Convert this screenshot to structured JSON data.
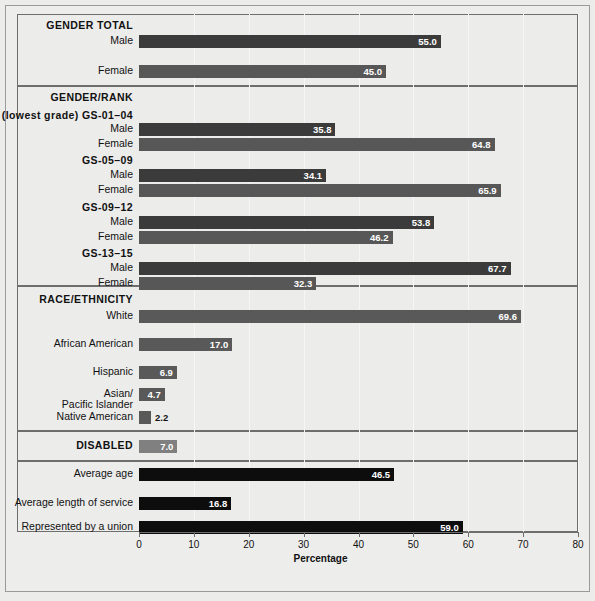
{
  "chart_data": {
    "type": "bar",
    "title": "",
    "xlabel": "Percentage",
    "ylabel": "",
    "xlim": [
      0,
      80
    ],
    "xticks": [
      0,
      10,
      20,
      30,
      40,
      50,
      60,
      70,
      80
    ],
    "grid": true,
    "orientation": "horizontal",
    "legend": "none",
    "colors": {
      "male": "#3b3b3b",
      "female": "#575757",
      "race": "#595959",
      "disabled": "#808080",
      "other": "#0d0d0d",
      "panel_background": "#ececeb",
      "border": "#6e6e6e",
      "gridline": "#f6f6f6",
      "label_inside": "#ffffff",
      "label_outside": "#111111"
    },
    "sections": [
      {
        "name": "gender-total",
        "heading": "GENDER TOTAL",
        "subheadings": [],
        "rows": [
          {
            "label": "Male",
            "value": 55.0,
            "display": "55.0",
            "series": "male",
            "label_position": "inside"
          },
          {
            "label": "Female",
            "value": 45.0,
            "display": "45.0",
            "series": "female",
            "label_position": "inside"
          }
        ]
      },
      {
        "name": "gender-rank",
        "heading": "GENDER/RANK",
        "subheadings": [
          "(lowest grade) GS-01–04",
          "GS-05–09",
          "GS-09–12",
          "GS-13–15"
        ],
        "rows": [
          {
            "label": "(lowest grade) GS-01–04",
            "value": null,
            "display": "",
            "series": "subheading",
            "label_position": "none"
          },
          {
            "label": "Male",
            "value": 35.8,
            "display": "35.8",
            "series": "male",
            "label_position": "inside"
          },
          {
            "label": "Female",
            "value": 64.8,
            "display": "64.8",
            "series": "female",
            "label_position": "inside"
          },
          {
            "label": "GS-05–09",
            "value": null,
            "display": "",
            "series": "subheading",
            "label_position": "none"
          },
          {
            "label": "Male",
            "value": 34.1,
            "display": "34.1",
            "series": "male",
            "label_position": "inside"
          },
          {
            "label": "Female",
            "value": 65.9,
            "display": "65.9",
            "series": "female",
            "label_position": "inside"
          },
          {
            "label": "GS-09–12",
            "value": null,
            "display": "",
            "series": "subheading",
            "label_position": "none"
          },
          {
            "label": "Male",
            "value": 53.8,
            "display": "53.8",
            "series": "male",
            "label_position": "inside"
          },
          {
            "label": "Female",
            "value": 46.2,
            "display": "46.2",
            "series": "female",
            "label_position": "inside"
          },
          {
            "label": "GS-13–15",
            "value": null,
            "display": "",
            "series": "subheading",
            "label_position": "none"
          },
          {
            "label": "Male",
            "value": 67.7,
            "display": "67.7",
            "series": "male",
            "label_position": "inside"
          },
          {
            "label": "Female",
            "value": 32.3,
            "display": "32.3",
            "series": "female",
            "label_position": "inside"
          }
        ]
      },
      {
        "name": "race-ethnicity",
        "heading": "RACE/ETHNICITY",
        "subheadings": [],
        "rows": [
          {
            "label": "White",
            "value": 69.6,
            "display": "69.6",
            "series": "race",
            "label_position": "inside"
          },
          {
            "label": "African American",
            "value": 17.0,
            "display": "17.0",
            "series": "race",
            "label_position": "inside"
          },
          {
            "label": "Hispanic",
            "value": 6.9,
            "display": "6.9",
            "series": "race",
            "label_position": "inside"
          },
          {
            "label": "Asian/\nPacific Islander",
            "value": 4.7,
            "display": "4.7",
            "series": "race",
            "label_position": "inside"
          },
          {
            "label": "Native American",
            "value": 2.2,
            "display": "2.2",
            "series": "race",
            "label_position": "outside"
          }
        ]
      },
      {
        "name": "disabled",
        "heading": "DISABLED",
        "subheadings": [],
        "rows": [
          {
            "label": "DISABLED",
            "value": 7.0,
            "display": "7.0",
            "series": "disabled",
            "label_position": "inside"
          }
        ]
      },
      {
        "name": "other-measures",
        "heading": "",
        "subheadings": [],
        "rows": [
          {
            "label": "Average age",
            "value": 46.5,
            "display": "46.5",
            "series": "other",
            "label_position": "inside"
          },
          {
            "label": "Average length of service",
            "value": 16.8,
            "display": "16.8",
            "series": "other",
            "label_position": "inside"
          },
          {
            "label": "Represented by a union",
            "value": 59.0,
            "display": "59.0",
            "series": "other",
            "label_position": "inside"
          }
        ]
      }
    ]
  },
  "axis": {
    "title": "Percentage",
    "tick_labels": [
      "0",
      "10",
      "20",
      "30",
      "40",
      "50",
      "60",
      "70",
      "80"
    ]
  },
  "caption": {
    "text": ""
  }
}
